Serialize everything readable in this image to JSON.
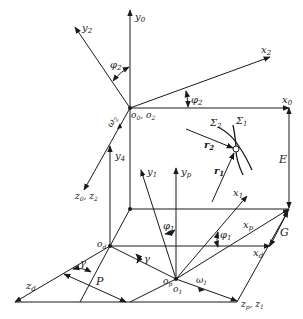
{
  "diagram": {
    "colors": {
      "stroke": "#1a1a1a",
      "background": "#ffffff"
    },
    "axes": {
      "y0": "y",
      "y0_sub": "0",
      "y2": "y",
      "y2_sub": "2",
      "x2": "x",
      "x2_sub": "2",
      "x0": "x",
      "x0_sub": "0",
      "z0z2": "z",
      "z0z2_sub": "0",
      "z0z2_sep": ", z",
      "z0z2_sub2": "2",
      "y4": "y",
      "y4_sub": "4",
      "y1": "y",
      "y1_sub": "1",
      "yp": "y",
      "yp_sub": "p",
      "x1": "x",
      "x1_sub": "1",
      "xp": "x",
      "xp_sub": "p",
      "xd": "x",
      "xd_sub": "d",
      "zd": "z",
      "zd_sub": "d",
      "zpz1": "z",
      "zpz1_sub": "p",
      "zpz1_sep": ", z",
      "zpz1_sub2": "1"
    },
    "origins": {
      "o0o2": "o",
      "o0o2_sub": "0",
      "o0o2_sep": ", o",
      "o0o2_sub2": "2",
      "od": "o",
      "od_sub": "d",
      "op": "o",
      "op_sub": "p",
      "o1": "o",
      "o1_sub": "1"
    },
    "angles": {
      "phi2_top": "φ",
      "phi2_top_sub": "2",
      "phi2_right": "φ",
      "phi2_right_sub": "2",
      "phi1_left": "φ",
      "phi1_left_sub": "1",
      "phi1_right": "φ",
      "phi1_right_sub": "1",
      "gamma_left": "γ",
      "gamma_right": "γ"
    },
    "angular_velocities": {
      "omega2": "ω",
      "omega2_sub": "2",
      "omega1": "ω",
      "omega1_sub": "1"
    },
    "surfaces": {
      "sigma2": "Σ",
      "sigma2_sub": "2",
      "sigma1": "Σ",
      "sigma1_sub": "1"
    },
    "vectors": {
      "r2": "r",
      "r2_sub": "2",
      "r1": "r",
      "r1_sub": "1"
    },
    "dimensions": {
      "E": "E",
      "G": "G",
      "P": "P"
    }
  }
}
